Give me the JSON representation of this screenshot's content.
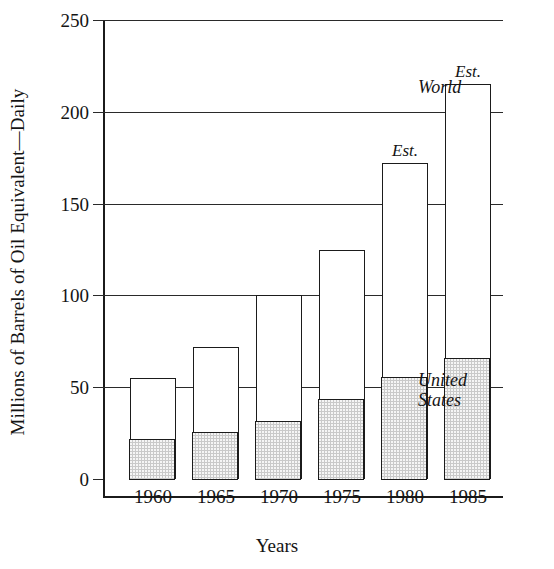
{
  "chart_data": {
    "type": "bar",
    "title": "",
    "subtitle": "",
    "xlabel": "Years",
    "ylabel": "Millions of Barrels of Oil Equivalent—Daily",
    "categories": [
      "1960",
      "1965",
      "1970",
      "1975",
      "1980",
      "1985"
    ],
    "ylim": [
      0,
      250
    ],
    "yticks": [
      0,
      50,
      100,
      150,
      200,
      250
    ],
    "ytick_labels": [
      "0",
      "50",
      "100",
      "150",
      "200",
      "250"
    ],
    "grid": "horizontal",
    "legend_position": "inline-annotations",
    "series": [
      {
        "name": "World",
        "values": [
          55,
          72,
          100,
          125,
          172,
          215
        ],
        "style": "open-outline"
      },
      {
        "name": "United States",
        "values": [
          22,
          26,
          32,
          44,
          56,
          66
        ],
        "style": "shaded"
      }
    ],
    "annotations": [
      {
        "text": "Est.",
        "category": "1980",
        "position": "above-bar"
      },
      {
        "text": "Est.",
        "category": "1985",
        "position": "above-bar"
      },
      {
        "text": "World",
        "position": "right-of-1985-top"
      },
      {
        "text": "United\nStates",
        "position": "right-of-1985-shaded"
      }
    ]
  },
  "axis": {
    "y_title": "Millions of Barrels of Oil Equivalent—Daily",
    "x_title": "Years",
    "y_ticks": [
      {
        "label": "250",
        "value": 250
      },
      {
        "label": "200",
        "value": 200
      },
      {
        "label": "150",
        "value": 150
      },
      {
        "label": "100",
        "value": 100
      },
      {
        "label": "50",
        "value": 50
      },
      {
        "label": "0",
        "value": 0
      }
    ]
  },
  "bars": [
    {
      "year": "1960",
      "world": 55,
      "united_states": 22,
      "est_label": ""
    },
    {
      "year": "1965",
      "world": 72,
      "united_states": 26,
      "est_label": ""
    },
    {
      "year": "1970",
      "world": 100,
      "united_states": 32,
      "est_label": ""
    },
    {
      "year": "1975",
      "world": 125,
      "united_states": 44,
      "est_label": ""
    },
    {
      "year": "1980",
      "world": 172,
      "united_states": 56,
      "est_label": "Est."
    },
    {
      "year": "1985",
      "world": 215,
      "united_states": 66,
      "est_label": "Est."
    }
  ],
  "labels": {
    "world": "World",
    "united_states": "United\nStates"
  },
  "colors": {
    "ink": "#1b1b1b",
    "shaded_fill": "#c9c9c9",
    "background": "#ffffff",
    "gridline": "#2a2a2a"
  }
}
